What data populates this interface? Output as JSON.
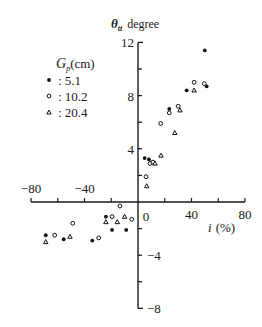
{
  "chart_data": {
    "type": "scatter",
    "title": "",
    "ylabel_symbol": "θ",
    "ylabel_sub": "tt",
    "ylabel_unit": "degree",
    "xlabel_symbol": "i",
    "xlabel_unit": "(%)",
    "xlim": [
      -80,
      80
    ],
    "ylim": [
      -8,
      12
    ],
    "x_ticks": [
      -80,
      -60,
      -40,
      -20,
      0,
      20,
      40,
      60,
      80
    ],
    "x_tick_labels": [
      {
        "value": -80,
        "label": "−80"
      },
      {
        "value": -40,
        "label": "−40"
      },
      {
        "value": 0,
        "label": "0"
      },
      {
        "value": 40,
        "label": "40"
      },
      {
        "value": 80,
        "label": "80"
      }
    ],
    "y_ticks": [
      -8,
      -6,
      -4,
      -2,
      0,
      2,
      4,
      6,
      8,
      10,
      12
    ],
    "y_tick_labels": [
      {
        "value": 12,
        "label": "12",
        "side": "left"
      },
      {
        "value": 8,
        "label": "8",
        "side": "left"
      },
      {
        "value": 4,
        "label": "4",
        "side": "left"
      },
      {
        "value": -4,
        "label": "−4",
        "side": "right"
      },
      {
        "value": -8,
        "label": "−8",
        "side": "right"
      }
    ],
    "grid": false,
    "legend": {
      "title_symbol": "G",
      "title_sub": "p",
      "title_unit": "(cm)",
      "position": "upper-left",
      "entries": [
        {
          "marker": "filled-circle",
          "label": ": 5.1"
        },
        {
          "marker": "open-circle",
          "label": ": 10.2"
        },
        {
          "marker": "triangle",
          "label": ": 20.4"
        }
      ]
    },
    "series": [
      {
        "name": "5.1",
        "marker": "filled-circle",
        "points": [
          [
            50,
            11.4
          ],
          [
            36.4,
            8.4
          ],
          [
            51.4,
            8.7
          ],
          [
            23.4,
            7.0
          ],
          [
            5,
            3.3
          ],
          [
            8.2,
            3.2
          ],
          [
            -8.8,
            -2.1
          ],
          [
            -24,
            -1.1
          ],
          [
            -19.4,
            -2.1
          ],
          [
            -34.2,
            -2.9
          ],
          [
            -55.6,
            -2.8
          ],
          [
            -69,
            -2.5
          ]
        ]
      },
      {
        "name": "10.2",
        "marker": "open-circle",
        "points": [
          [
            42,
            9.0
          ],
          [
            49.6,
            8.9
          ],
          [
            23.4,
            6.7
          ],
          [
            30.1,
            7.2
          ],
          [
            17,
            5.9
          ],
          [
            9,
            2.9
          ],
          [
            11.2,
            3.0
          ],
          [
            6,
            1.9
          ],
          [
            -13.5,
            -0.3
          ],
          [
            -4.7,
            -1.3
          ],
          [
            -19.4,
            -1.1
          ],
          [
            -29.4,
            -2.7
          ],
          [
            -48.8,
            -1.6
          ],
          [
            -62.3,
            -2.5
          ]
        ]
      },
      {
        "name": "20.4",
        "marker": "triangle",
        "points": [
          [
            42,
            8.4
          ],
          [
            31.4,
            6.9
          ],
          [
            27.5,
            5.2
          ],
          [
            17.2,
            3.5
          ],
          [
            12.7,
            2.9
          ],
          [
            6.5,
            1.2
          ],
          [
            -10,
            -1.1
          ],
          [
            -24,
            -1.5
          ],
          [
            -15.5,
            -1.5
          ],
          [
            -50.9,
            -2.6
          ],
          [
            -69,
            -3.0
          ]
        ]
      }
    ]
  }
}
